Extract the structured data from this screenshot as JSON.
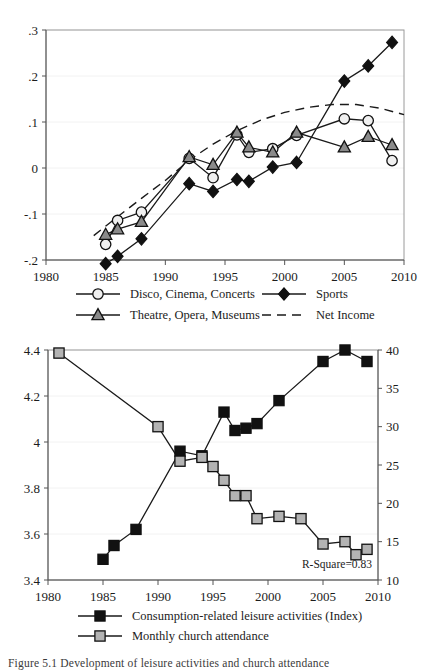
{
  "page": {
    "clipped_header_text": "",
    "caption": "Figure 5.1   Development of leisure activities and church attendance"
  },
  "chart_data": [
    {
      "id": "top",
      "type": "line",
      "title": "",
      "xlabel": "",
      "ylabel": "",
      "xlim": [
        1980,
        2010
      ],
      "ylim": [
        -0.2,
        0.3
      ],
      "xticks": [
        1980,
        1985,
        1990,
        1995,
        2000,
        2005,
        2010
      ],
      "xticklabels": [
        "1980",
        "1985",
        "1990",
        "1995",
        "2000",
        "2005",
        "2010"
      ],
      "yticks": [
        -0.2,
        -0.1,
        0,
        0.1,
        0.2,
        0.3
      ],
      "yticklabels": [
        "-.2",
        "-.1",
        "0",
        ".1",
        ".2",
        ".3"
      ],
      "grid": true,
      "legend_position": "below",
      "series": [
        {
          "name": "Disco, Cinema, Concerts",
          "marker": "circle-open",
          "x": [
            1985,
            1986,
            1988,
            1992,
            1994,
            1996,
            1997,
            1999,
            2001,
            2005,
            2007,
            2009
          ],
          "y": [
            -0.166,
            -0.114,
            -0.096,
            0.021,
            -0.021,
            0.072,
            0.034,
            0.042,
            0.071,
            0.107,
            0.103,
            0.016
          ]
        },
        {
          "name": "Theatre, Opera, Museums",
          "marker": "triangle-grey",
          "x": [
            1985,
            1986,
            1988,
            1992,
            1994,
            1996,
            1997,
            1999,
            2001,
            2005,
            2007,
            2009
          ],
          "y": [
            -0.145,
            -0.133,
            -0.117,
            0.024,
            0.007,
            0.077,
            0.045,
            0.034,
            0.077,
            0.045,
            0.068,
            0.05
          ]
        },
        {
          "name": "Sports",
          "marker": "diamond-black",
          "x": [
            1985,
            1986,
            1988,
            1992,
            1994,
            1996,
            1997,
            1999,
            2001,
            2005,
            2007,
            2009
          ],
          "y": [
            -0.208,
            -0.192,
            -0.154,
            -0.034,
            -0.051,
            -0.025,
            -0.029,
            0.002,
            0.012,
            0.189,
            0.222,
            0.273
          ]
        },
        {
          "name": "Net Income",
          "marker": "dashed-line",
          "x": [
            1984,
            1986,
            1988,
            1990,
            1992,
            1994,
            1996,
            1998,
            2000,
            2002,
            2004,
            2006,
            2008,
            2010
          ],
          "y": [
            -0.147,
            -0.106,
            -0.066,
            -0.027,
            0.017,
            0.052,
            0.081,
            0.104,
            0.121,
            0.132,
            0.138,
            0.138,
            0.13,
            0.116
          ]
        }
      ],
      "legend": [
        {
          "label": "Disco, Cinema, Concerts",
          "marker": "circle-open"
        },
        {
          "label": "Sports",
          "marker": "diamond-black"
        },
        {
          "label": "Theatre, Opera, Museums",
          "marker": "triangle-grey"
        },
        {
          "label": "Net Income",
          "marker": "dashed-line"
        }
      ]
    },
    {
      "id": "bottom",
      "type": "line",
      "title": "",
      "xlabel": "",
      "ylabel": "",
      "xlim": [
        1980,
        2010
      ],
      "ylim_left": [
        3.4,
        4.4
      ],
      "ylim_right": [
        10,
        40
      ],
      "xticks": [
        1980,
        1985,
        1990,
        1995,
        2000,
        2005,
        2010
      ],
      "xticklabels": [
        "1980",
        "1985",
        "1990",
        "1995",
        "2000",
        "2005",
        "2010"
      ],
      "yticks_left": [
        3.4,
        3.6,
        3.8,
        4.0,
        4.2,
        4.4
      ],
      "yticklabels_left": [
        "3.4",
        "3.6",
        "3.8",
        "4",
        "4.2",
        "4.4"
      ],
      "yticks_right": [
        10,
        15,
        20,
        25,
        30,
        35,
        40
      ],
      "yticklabels_right": [
        "10",
        "15",
        "20",
        "25",
        "30",
        "35",
        "40"
      ],
      "grid": true,
      "legend_position": "below",
      "annotation": "R-Square=0.83",
      "series": [
        {
          "name": "Consumption-related leisure activities (Index)",
          "marker": "square-black",
          "axis": "left",
          "x": [
            1985,
            1986,
            1988,
            1992,
            1994,
            1996,
            1997,
            1998,
            1999,
            2001,
            2005,
            2007,
            2009
          ],
          "y": [
            3.49,
            3.55,
            3.62,
            3.96,
            3.94,
            4.13,
            4.05,
            4.06,
            4.08,
            4.18,
            4.35,
            4.4,
            4.35
          ]
        },
        {
          "name": "Monthly church attendance",
          "marker": "square-grey",
          "axis": "right",
          "x": [
            1981,
            1990,
            1992,
            1994,
            1995,
            1996,
            1997,
            1998,
            1999,
            2001,
            2003,
            2005,
            2007,
            2008,
            2009
          ],
          "y": [
            39.6,
            30.0,
            25.5,
            26.0,
            24.8,
            23.0,
            21.0,
            21.0,
            18.0,
            18.3,
            18.0,
            14.7,
            15.0,
            13.3,
            14.0
          ]
        }
      ],
      "legend": [
        {
          "label": "Consumption-related leisure activities (Index)",
          "marker": "square-black"
        },
        {
          "label": "Monthly church attendance",
          "marker": "square-grey"
        }
      ]
    }
  ]
}
